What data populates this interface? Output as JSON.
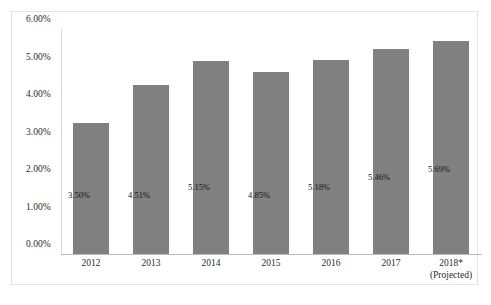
{
  "chart_data": {
    "type": "bar",
    "title": "",
    "subtitle": "",
    "xlabel": "",
    "ylabel": "",
    "categories": [
      "2012",
      "2013",
      "2014",
      "2015",
      "2016",
      "2017",
      "2018*"
    ],
    "category_sublabels": [
      "",
      "",
      "",
      "",
      "",
      "",
      "(Projected)"
    ],
    "values": [
      3.5,
      4.51,
      5.15,
      4.85,
      5.18,
      5.46,
      5.69
    ],
    "data_labels": [
      "3.50%",
      "4.51%",
      "5.15%",
      "4.85%",
      "5.18%",
      "5.46%",
      "5.69%"
    ],
    "ylim": [
      0,
      6
    ],
    "ytick_values": [
      6.0,
      5.0,
      4.0,
      3.0,
      2.0,
      1.0,
      0.0
    ],
    "ytick_labels": [
      "6.00%",
      "5.00%",
      "4.00%",
      "3.00%",
      "2.00%",
      "1.00%",
      "0.00%"
    ],
    "grid": false,
    "legend": "none",
    "series": [
      {
        "name": "",
        "values": [
          3.5,
          4.51,
          5.15,
          4.85,
          5.18,
          5.46,
          5.69
        ],
        "color": "#808080"
      }
    ]
  },
  "colors": {
    "bar_fill": "#808080",
    "plot_background": "#ffffff",
    "frame_border": "#e3e3e3",
    "axis_line": "#bdbdbd",
    "tick_text": "#2b2b2b",
    "label_text": "#171717"
  }
}
